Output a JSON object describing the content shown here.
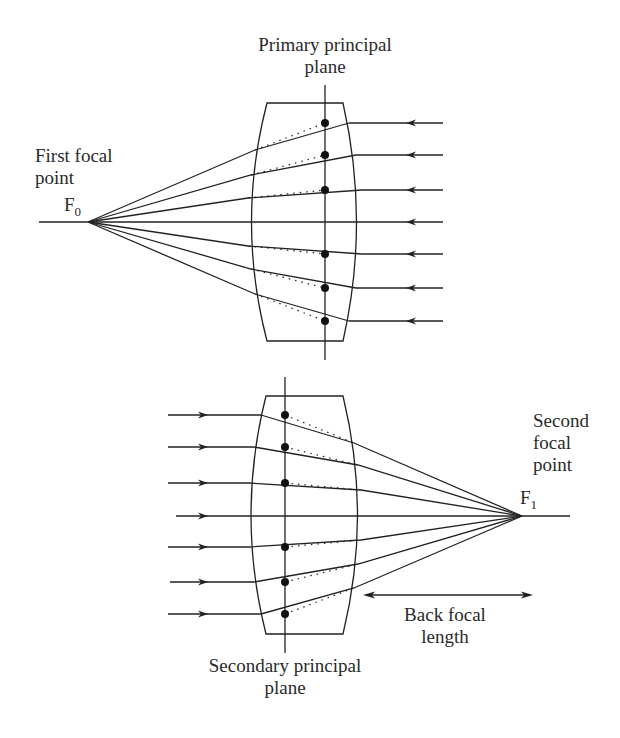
{
  "top_diagram": {
    "title_line1": "Primary principal",
    "title_line2": "plane",
    "focal_label_line1": "First focal",
    "focal_label_line2": "point",
    "focal_symbol": "F",
    "focal_subscript": "0"
  },
  "bottom_diagram": {
    "title_line1": "Secondary principal",
    "title_line2": "plane",
    "focal_label_line1": "Second",
    "focal_label_line2": "focal",
    "focal_label_line3": "point",
    "focal_symbol": "F",
    "focal_subscript": "1",
    "distance_label_line1": "Back focal",
    "distance_label_line2": "length"
  },
  "colors": {
    "line": "#222222",
    "background": "#ffffff"
  }
}
